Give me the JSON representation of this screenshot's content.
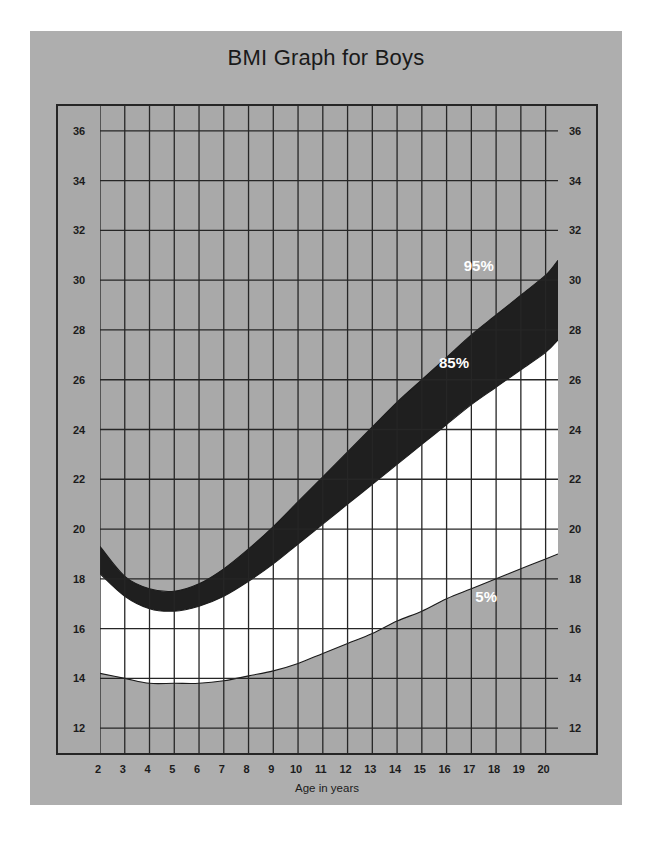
{
  "page": {
    "background_color": "#ffffff",
    "card_color": "#aeaeae"
  },
  "header": {
    "title": "BMI Graph for Boys"
  },
  "axes": {
    "x_label": "Age in years",
    "x_ticks": [
      2,
      3,
      4,
      5,
      6,
      7,
      8,
      9,
      10,
      11,
      12,
      13,
      14,
      15,
      16,
      17,
      18,
      19,
      20
    ],
    "x_min": 2,
    "x_max": 20.5,
    "y_ticks_left": [
      36,
      34,
      32,
      30,
      28,
      26,
      24,
      22,
      20,
      18,
      16,
      14,
      12
    ],
    "y_ticks_right": [
      36,
      34,
      32,
      30,
      28,
      26,
      24,
      22,
      20,
      18,
      16,
      14,
      12
    ],
    "y_min": 11,
    "y_max": 37,
    "grid": true,
    "grid_color": "#262626",
    "frame_color": "#262626"
  },
  "legend": {
    "items": [
      {
        "label": "95%",
        "x": 17.3,
        "y": 30.6,
        "color": "#ffffff"
      },
      {
        "label": "85%",
        "x": 16.3,
        "y": 26.7,
        "color": "#ffffff"
      },
      {
        "label": "5%",
        "x": 17.6,
        "y": 17.3,
        "color": "#ffffff"
      }
    ]
  },
  "colors": {
    "plot_background": "#a9a9a9",
    "band_5_to_85": "#ffffff",
    "band_85_to_95": "#1f1f1f",
    "outside_band": "#a9a9a9",
    "curve_outline": "#1a1a1a"
  },
  "chart_data": {
    "type": "area",
    "title": "BMI Graph for Boys",
    "xlabel": "Age in years",
    "ylabel": "",
    "xlim": [
      2,
      20.5
    ],
    "ylim": [
      11,
      37
    ],
    "grid": true,
    "legend_position": "inline-annotations",
    "x": [
      2,
      3,
      4,
      5,
      6,
      7,
      8,
      9,
      10,
      11,
      12,
      13,
      14,
      15,
      16,
      17,
      18,
      19,
      20,
      20.5
    ],
    "series": [
      {
        "name": "95%",
        "label": "95th percentile",
        "values": [
          19.3,
          18.1,
          17.6,
          17.5,
          17.8,
          18.4,
          19.2,
          20.1,
          21.1,
          22.1,
          23.1,
          24.1,
          25.1,
          26.0,
          26.9,
          27.8,
          28.6,
          29.4,
          30.2,
          30.8
        ]
      },
      {
        "name": "85%",
        "label": "85th percentile",
        "values": [
          18.2,
          17.3,
          16.8,
          16.7,
          16.9,
          17.3,
          17.9,
          18.6,
          19.4,
          20.2,
          21.0,
          21.8,
          22.6,
          23.4,
          24.2,
          25.0,
          25.7,
          26.4,
          27.1,
          27.6
        ]
      },
      {
        "name": "5%",
        "label": "5th percentile",
        "values": [
          14.2,
          14.0,
          13.8,
          13.8,
          13.8,
          13.9,
          14.1,
          14.3,
          14.6,
          15.0,
          15.4,
          15.8,
          16.3,
          16.7,
          17.2,
          17.6,
          18.0,
          18.4,
          18.8,
          19.0
        ]
      }
    ],
    "bands": [
      {
        "name": "85th-95th percentile",
        "lower_series": "85%",
        "upper_series": "95%",
        "fill": "#1f1f1f"
      },
      {
        "name": "5th-85th percentile",
        "lower_series": "5%",
        "upper_series": "85%",
        "fill": "#ffffff"
      }
    ],
    "annotations": [
      {
        "text": "95%",
        "x": 17.3,
        "y": 30.6
      },
      {
        "text": "85%",
        "x": 16.3,
        "y": 26.7
      },
      {
        "text": "5%",
        "x": 17.6,
        "y": 17.3
      }
    ]
  }
}
